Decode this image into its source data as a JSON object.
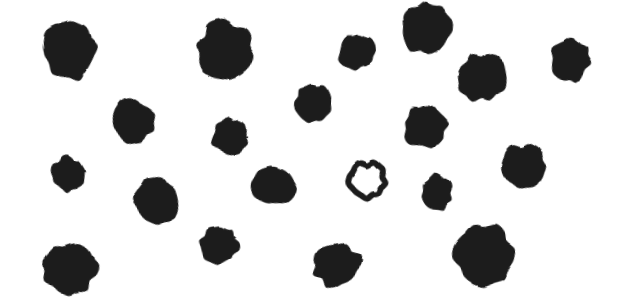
{
  "scene": {
    "title": "Irregular dark blob field",
    "width": 624,
    "height": 305,
    "background_color": "#ffffff",
    "blob_color": "#1d1d1d",
    "blob_color_secondary": "#2a2a28",
    "total_shapes": 20,
    "filled_count": 19,
    "outlined_count": 1,
    "description": "Scattered hand-drawn dark filled blobs on a white ground with a single hollow ring-shaped blob near the center-right."
  },
  "shapes": [
    {
      "id": "blob-01",
      "kind": "filled",
      "cx": 70,
      "cy": 50,
      "rx": 25,
      "ry": 30,
      "rotate": -8,
      "seed": 11
    },
    {
      "id": "blob-02",
      "kind": "filled",
      "cx": 224,
      "cy": 50,
      "rx": 27,
      "ry": 29,
      "rotate": 14,
      "seed": 23
    },
    {
      "id": "blob-03",
      "kind": "filled",
      "cx": 357,
      "cy": 52,
      "rx": 18,
      "ry": 17,
      "rotate": -5,
      "seed": 31
    },
    {
      "id": "blob-04",
      "kind": "filled",
      "cx": 427,
      "cy": 28,
      "rx": 25,
      "ry": 26,
      "rotate": 6,
      "seed": 7
    },
    {
      "id": "blob-05",
      "kind": "filled",
      "cx": 481,
      "cy": 77,
      "rx": 24,
      "ry": 23,
      "rotate": -12,
      "seed": 43
    },
    {
      "id": "blob-06",
      "kind": "filled",
      "cx": 570,
      "cy": 60,
      "rx": 19,
      "ry": 22,
      "rotate": 9,
      "seed": 17
    },
    {
      "id": "blob-07",
      "kind": "filled",
      "cx": 132,
      "cy": 121,
      "rx": 21,
      "ry": 21,
      "rotate": -16,
      "seed": 29
    },
    {
      "id": "blob-08",
      "kind": "filled",
      "cx": 313,
      "cy": 103,
      "rx": 17,
      "ry": 18,
      "rotate": 3,
      "seed": 37
    },
    {
      "id": "blob-09",
      "kind": "filled",
      "cx": 230,
      "cy": 137,
      "rx": 17,
      "ry": 18,
      "rotate": 20,
      "seed": 5
    },
    {
      "id": "blob-10",
      "kind": "filled",
      "cx": 425,
      "cy": 127,
      "rx": 21,
      "ry": 21,
      "rotate": -7,
      "seed": 41
    },
    {
      "id": "blob-11",
      "kind": "filled",
      "cx": 68,
      "cy": 174,
      "rx": 16,
      "ry": 17,
      "rotate": 11,
      "seed": 13
    },
    {
      "id": "blob-12",
      "kind": "filled",
      "cx": 156,
      "cy": 202,
      "rx": 21,
      "ry": 23,
      "rotate": -14,
      "seed": 19
    },
    {
      "id": "blob-13",
      "kind": "filled",
      "cx": 273,
      "cy": 186,
      "rx": 21,
      "ry": 19,
      "rotate": 8,
      "seed": 47
    },
    {
      "id": "blob-14",
      "kind": "outlined",
      "cx": 367,
      "cy": 180,
      "rx": 17,
      "ry": 17,
      "rotate": -10,
      "seed": 3,
      "stroke_width": 6
    },
    {
      "id": "blob-15",
      "kind": "filled",
      "cx": 437,
      "cy": 192,
      "rx": 15,
      "ry": 18,
      "rotate": 5,
      "seed": 53
    },
    {
      "id": "blob-16",
      "kind": "filled",
      "cx": 524,
      "cy": 166,
      "rx": 22,
      "ry": 21,
      "rotate": -18,
      "seed": 59
    },
    {
      "id": "blob-17",
      "kind": "filled",
      "cx": 70,
      "cy": 268,
      "rx": 26,
      "ry": 25,
      "rotate": 13,
      "seed": 61
    },
    {
      "id": "blob-18",
      "kind": "filled",
      "cx": 219,
      "cy": 245,
      "rx": 19,
      "ry": 18,
      "rotate": -6,
      "seed": 67
    },
    {
      "id": "blob-19",
      "kind": "filled",
      "cx": 337,
      "cy": 265,
      "rx": 23,
      "ry": 22,
      "rotate": 16,
      "seed": 71
    },
    {
      "id": "blob-20",
      "kind": "filled",
      "cx": 484,
      "cy": 254,
      "rx": 29,
      "ry": 29,
      "rotate": -9,
      "seed": 73
    }
  ]
}
